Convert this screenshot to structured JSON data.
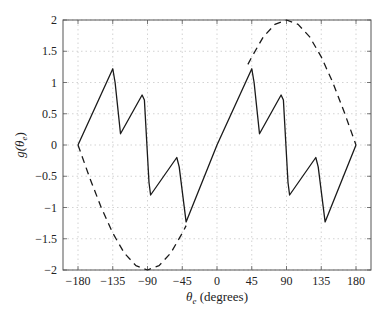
{
  "chart_data": {
    "type": "line",
    "title": "",
    "xlabel": "θe (degrees)",
    "ylabel": "g(θe)",
    "xlim": [
      -180,
      180
    ],
    "ylim": [
      -2,
      2
    ],
    "grid": true,
    "legend": null,
    "xticks": [
      -180,
      -135,
      -90,
      -45,
      0,
      45,
      90,
      135,
      180
    ],
    "yticks": [
      -2,
      -1.5,
      -1,
      -0.5,
      0,
      0.5,
      1,
      1.5,
      2
    ],
    "xtick_labels": [
      "−180",
      "−135",
      "−90",
      "−45",
      "0",
      "45",
      "90",
      "135",
      "180"
    ],
    "ytick_labels": [
      "−2",
      "−1.5",
      "−1",
      "−0.5",
      "0",
      "0.5",
      "1",
      "1.5",
      "2"
    ],
    "series": [
      {
        "name": "g(θe) solid",
        "style": "solid",
        "x": [
          -180,
          -135,
          -132,
          -125,
          -97,
          -94,
          -88,
          -86,
          -52,
          -49,
          -40,
          0,
          45,
          48,
          55,
          83,
          86,
          92,
          94,
          128,
          131,
          140,
          180
        ],
        "y": [
          0,
          1.22,
          1.0,
          0.18,
          0.8,
          0.72,
          -0.6,
          -0.8,
          -0.2,
          -0.35,
          -1.23,
          0,
          1.22,
          1.0,
          0.18,
          0.8,
          0.72,
          -0.6,
          -0.8,
          -0.2,
          -0.35,
          -1.23,
          0
        ]
      },
      {
        "name": "envelope dashed (lower)",
        "style": "dashed",
        "x": [
          -180,
          -165,
          -150,
          -135,
          -120,
          -105,
          -90,
          -75,
          -60,
          -45,
          -40
        ],
        "y": [
          0,
          -0.52,
          -1.0,
          -1.41,
          -1.73,
          -1.93,
          -2.0,
          -1.93,
          -1.73,
          -1.41,
          -1.29
        ]
      },
      {
        "name": "envelope dashed (upper)",
        "style": "dashed",
        "x": [
          40,
          45,
          60,
          75,
          90,
          105,
          120,
          135,
          150,
          165,
          180
        ],
        "y": [
          1.29,
          1.41,
          1.73,
          1.93,
          2.0,
          1.93,
          1.73,
          1.41,
          1.0,
          0.52,
          0
        ]
      }
    ]
  },
  "labels": {
    "x_axis_main": "θ",
    "x_axis_sub": "e",
    "x_axis_units": " (degrees)",
    "y_axis_main": "g(θ",
    "y_axis_sub": "e",
    "y_axis_close": ")"
  },
  "colors": {
    "line": "#1a1a1a",
    "grid": "#c8c8c8",
    "axes": "#555555"
  }
}
